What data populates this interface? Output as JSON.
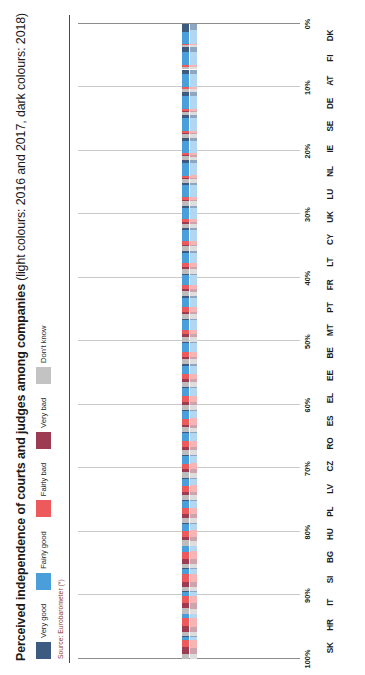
{
  "header": {
    "title_bold": "Perceived independence of courts and judges among companies",
    "title_sub": " (light colours: 2016 and 2017, dark colours: 2018)",
    "source": "Source: Eurobarometer (*)"
  },
  "legend": {
    "items": [
      {
        "label": "Very good",
        "color": "#3d5a80",
        "name": "very-good"
      },
      {
        "label": "Fairly good",
        "color": "#4a9fdb",
        "name": "fairly-good"
      },
      {
        "label": "Fairly bad",
        "color": "#ec5a5c",
        "name": "fairly-bad"
      },
      {
        "label": "Very bad",
        "color": "#9d3b52",
        "name": "very-bad"
      },
      {
        "label": "Don't know",
        "color": "#c3c3c3",
        "name": "dont-know"
      }
    ]
  },
  "axis": {
    "x_ticks": [
      "100%",
      "90%",
      "80%",
      "70%",
      "60%",
      "50%",
      "40%",
      "30%",
      "20%",
      "10%",
      "0%"
    ],
    "x_min": 0,
    "x_max": 100,
    "reversed": true
  },
  "colors": {
    "very_good_dark": "#3d5a80",
    "very_good_light": "#8fa6c0",
    "fairly_good_dark": "#4a9fdb",
    "fairly_good_light": "#b3d7f0",
    "fairly_bad_dark": "#ec5a5c",
    "fairly_bad_light": "#f6b4b5",
    "very_bad_dark": "#9d3b52",
    "very_bad_light": "#cda3ac",
    "dont_know_dark": "#bdbdbd",
    "dont_know_light": "#dedede",
    "grid": "#c9c9c9",
    "axis": "#8d8d8d"
  },
  "chart_data": {
    "type": "bar",
    "orientation": "stacked-horizontal-rotated",
    "title": "Perceived independence of courts and judges among companies (light colours: 2016 and 2017, dark colours: 2018)",
    "xlabel": "",
    "ylabel": "",
    "ylim": [
      0,
      100
    ],
    "grid": true,
    "legend_position": "top-left",
    "series_names": [
      "Very good",
      "Fairly good",
      "Fairly bad",
      "Very bad",
      "Don't know"
    ],
    "categories": [
      "SK",
      "HR",
      "IT",
      "SI",
      "BG",
      "HU",
      "PL",
      "LV",
      "CZ",
      "RO",
      "ES",
      "EL",
      "EE",
      "BE",
      "MT",
      "PT",
      "FR",
      "LT",
      "CY",
      "UK",
      "LU",
      "NL",
      "IE",
      "SE",
      "DE",
      "AT",
      "FI",
      "DK"
    ],
    "groups": [
      {
        "country": "SK",
        "dark": {
          "very_good": 2,
          "fairly_good": 14,
          "fairly_bad": 31,
          "very_bad": 29,
          "dont_know": 24
        },
        "light": {
          "very_good": 2,
          "fairly_good": 15,
          "fairly_bad": 33,
          "very_bad": 30,
          "dont_know": 20
        }
      },
      {
        "country": "HR",
        "dark": {
          "very_good": 3,
          "fairly_good": 17,
          "fairly_bad": 33,
          "very_bad": 27,
          "dont_know": 20
        },
        "light": {
          "very_good": 3,
          "fairly_good": 18,
          "fairly_bad": 36,
          "very_bad": 24,
          "dont_know": 19
        }
      },
      {
        "country": "IT",
        "dark": {
          "very_good": 3,
          "fairly_good": 19,
          "fairly_bad": 29,
          "very_bad": 26,
          "dont_know": 23
        },
        "light": {
          "very_good": 3,
          "fairly_good": 20,
          "fairly_bad": 31,
          "very_bad": 24,
          "dont_know": 22
        }
      },
      {
        "country": "SI",
        "dark": {
          "very_good": 3,
          "fairly_good": 22,
          "fairly_bad": 35,
          "very_bad": 21,
          "dont_know": 19
        },
        "light": {
          "very_good": 3,
          "fairly_good": 20,
          "fairly_bad": 38,
          "very_bad": 23,
          "dont_know": 16
        }
      },
      {
        "country": "BG",
        "dark": {
          "very_good": 3,
          "fairly_good": 23,
          "fairly_bad": 32,
          "very_bad": 22,
          "dont_know": 20
        },
        "light": {
          "very_good": 3,
          "fairly_good": 22,
          "fairly_bad": 33,
          "very_bad": 23,
          "dont_know": 19
        }
      },
      {
        "country": "HU",
        "dark": {
          "very_good": 4,
          "fairly_good": 30,
          "fairly_bad": 26,
          "very_bad": 17,
          "dont_know": 23
        },
        "light": {
          "very_good": 4,
          "fairly_good": 28,
          "fairly_bad": 28,
          "very_bad": 18,
          "dont_know": 22
        }
      },
      {
        "country": "PL",
        "dark": {
          "very_good": 4,
          "fairly_good": 29,
          "fairly_bad": 28,
          "very_bad": 18,
          "dont_know": 21
        },
        "light": {
          "very_good": 4,
          "fairly_good": 31,
          "fairly_bad": 27,
          "very_bad": 16,
          "dont_know": 22
        }
      },
      {
        "country": "LV",
        "dark": {
          "very_good": 4,
          "fairly_good": 31,
          "fairly_bad": 27,
          "very_bad": 15,
          "dont_know": 23
        },
        "light": {
          "very_good": 4,
          "fairly_good": 30,
          "fairly_bad": 28,
          "very_bad": 16,
          "dont_know": 22
        }
      },
      {
        "country": "CZ",
        "dark": {
          "very_good": 5,
          "fairly_good": 33,
          "fairly_bad": 25,
          "very_bad": 14,
          "dont_know": 23
        },
        "light": {
          "very_good": 5,
          "fairly_good": 32,
          "fairly_bad": 26,
          "very_bad": 15,
          "dont_know": 22
        }
      },
      {
        "country": "RO",
        "dark": {
          "very_good": 5,
          "fairly_good": 34,
          "fairly_bad": 24,
          "very_bad": 14,
          "dont_know": 23
        },
        "light": {
          "very_good": 5,
          "fairly_good": 33,
          "fairly_bad": 25,
          "very_bad": 15,
          "dont_know": 22
        }
      },
      {
        "country": "ES",
        "dark": {
          "very_good": 5,
          "fairly_good": 35,
          "fairly_bad": 26,
          "very_bad": 13,
          "dont_know": 21
        },
        "light": {
          "very_good": 5,
          "fairly_good": 34,
          "fairly_bad": 27,
          "very_bad": 14,
          "dont_know": 20
        }
      },
      {
        "country": "EL",
        "dark": {
          "very_good": 6,
          "fairly_good": 36,
          "fairly_bad": 25,
          "very_bad": 13,
          "dont_know": 20
        },
        "light": {
          "very_good": 5,
          "fairly_good": 35,
          "fairly_bad": 26,
          "very_bad": 14,
          "dont_know": 20
        }
      },
      {
        "country": "EE",
        "dark": {
          "very_good": 6,
          "fairly_good": 38,
          "fairly_bad": 22,
          "very_bad": 11,
          "dont_know": 23
        },
        "light": {
          "very_good": 6,
          "fairly_good": 37,
          "fairly_bad": 23,
          "very_bad": 12,
          "dont_know": 22
        }
      },
      {
        "country": "BE",
        "dark": {
          "very_good": 6,
          "fairly_good": 39,
          "fairly_bad": 21,
          "very_bad": 11,
          "dont_know": 23
        },
        "light": {
          "very_good": 6,
          "fairly_good": 38,
          "fairly_bad": 22,
          "very_bad": 12,
          "dont_know": 22
        }
      },
      {
        "country": "MT",
        "dark": {
          "very_good": 7,
          "fairly_good": 41,
          "fairly_bad": 20,
          "very_bad": 10,
          "dont_know": 22
        },
        "light": {
          "very_good": 7,
          "fairly_good": 40,
          "fairly_bad": 21,
          "very_bad": 11,
          "dont_know": 21
        }
      },
      {
        "country": "PT",
        "dark": {
          "very_good": 7,
          "fairly_good": 42,
          "fairly_bad": 19,
          "very_bad": 10,
          "dont_know": 22
        },
        "light": {
          "very_good": 7,
          "fairly_good": 41,
          "fairly_bad": 20,
          "very_bad": 11,
          "dont_know": 21
        }
      },
      {
        "country": "FR",
        "dark": {
          "very_good": 8,
          "fairly_good": 44,
          "fairly_bad": 18,
          "very_bad": 9,
          "dont_know": 21
        },
        "light": {
          "very_good": 8,
          "fairly_good": 43,
          "fairly_bad": 19,
          "very_bad": 10,
          "dont_know": 20
        }
      },
      {
        "country": "LT",
        "dark": {
          "very_good": 8,
          "fairly_good": 46,
          "fairly_bad": 17,
          "very_bad": 8,
          "dont_know": 21
        },
        "light": {
          "very_good": 8,
          "fairly_good": 45,
          "fairly_bad": 18,
          "very_bad": 9,
          "dont_know": 20
        }
      },
      {
        "country": "CY",
        "dark": {
          "very_good": 9,
          "fairly_good": 48,
          "fairly_bad": 15,
          "very_bad": 7,
          "dont_know": 21
        },
        "light": {
          "very_good": 9,
          "fairly_good": 47,
          "fairly_bad": 16,
          "very_bad": 8,
          "dont_know": 20
        }
      },
      {
        "country": "UK",
        "dark": {
          "very_good": 10,
          "fairly_good": 50,
          "fairly_bad": 14,
          "very_bad": 6,
          "dont_know": 20
        },
        "light": {
          "very_good": 10,
          "fairly_good": 49,
          "fairly_bad": 15,
          "very_bad": 7,
          "dont_know": 19
        }
      },
      {
        "country": "LU",
        "dark": {
          "very_good": 11,
          "fairly_good": 52,
          "fairly_bad": 12,
          "very_bad": 5,
          "dont_know": 20
        },
        "light": {
          "very_good": 11,
          "fairly_good": 51,
          "fairly_bad": 13,
          "very_bad": 6,
          "dont_know": 19
        }
      },
      {
        "country": "NL",
        "dark": {
          "very_good": 13,
          "fairly_good": 55,
          "fairly_bad": 10,
          "very_bad": 4,
          "dont_know": 18
        },
        "light": {
          "very_good": 13,
          "fairly_good": 54,
          "fairly_bad": 11,
          "very_bad": 5,
          "dont_know": 17
        }
      },
      {
        "country": "IE",
        "dark": {
          "very_good": 14,
          "fairly_good": 56,
          "fairly_bad": 9,
          "very_bad": 4,
          "dont_know": 17
        },
        "light": {
          "very_good": 14,
          "fairly_good": 55,
          "fairly_bad": 10,
          "very_bad": 5,
          "dont_know": 16
        }
      },
      {
        "country": "SE",
        "dark": {
          "very_good": 16,
          "fairly_good": 57,
          "fairly_bad": 8,
          "very_bad": 3,
          "dont_know": 16
        },
        "light": {
          "very_good": 16,
          "fairly_good": 56,
          "fairly_bad": 9,
          "very_bad": 4,
          "dont_know": 15
        }
      },
      {
        "country": "DE",
        "dark": {
          "very_good": 18,
          "fairly_good": 58,
          "fairly_bad": 7,
          "very_bad": 3,
          "dont_know": 14
        },
        "light": {
          "very_good": 18,
          "fairly_good": 57,
          "fairly_bad": 8,
          "very_bad": 4,
          "dont_know": 13
        }
      },
      {
        "country": "AT",
        "dark": {
          "very_good": 20,
          "fairly_good": 59,
          "fairly_bad": 6,
          "very_bad": 2,
          "dont_know": 13
        },
        "light": {
          "very_good": 20,
          "fairly_good": 58,
          "fairly_bad": 7,
          "very_bad": 3,
          "dont_know": 12
        }
      },
      {
        "country": "FI",
        "dark": {
          "very_good": 21,
          "fairly_good": 61,
          "fairly_bad": 5,
          "very_bad": 2,
          "dont_know": 11
        },
        "light": {
          "very_good": 21,
          "fairly_good": 60,
          "fairly_bad": 6,
          "very_bad": 3,
          "dont_know": 10
        }
      },
      {
        "country": "DK",
        "dark": {
          "very_good": 34,
          "fairly_good": 52,
          "fairly_bad": 4,
          "very_bad": 2,
          "dont_know": 8
        },
        "light": {
          "very_good": 26,
          "fairly_good": 60,
          "fairly_bad": 5,
          "very_bad": 2,
          "dont_know": 7
        }
      }
    ]
  }
}
